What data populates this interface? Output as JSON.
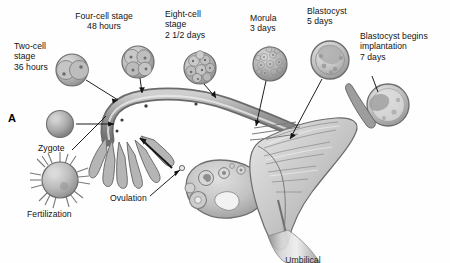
{
  "figure": {
    "panel_letter": "A",
    "title_implied": "Human embryonic development from fertilization to implantation",
    "background_color": "#ffffff",
    "ink_color": "#111111",
    "style": "grayscale medical illustration"
  },
  "labels": {
    "two_cell": "Two-cell\nstage\n36 hours",
    "four_cell": "Four-cell stage\n48 hours",
    "eight_cell": "Eight-cell\nstage\n2 1/2 days",
    "morula": "Morula\n3 days",
    "blastocyst": "Blastocyst\n5 days",
    "implantation": "Blastocyst begins\nimplantation\n7 days",
    "zygote": "Zygote",
    "fertilization": "Fertilization",
    "ovulation": "Ovulation",
    "umbilical": "Umbilical"
  },
  "stages": [
    {
      "name": "Fertilization",
      "time": "",
      "cells": "sperm surrounding oocyte"
    },
    {
      "name": "Zygote",
      "time": "",
      "cells": "1"
    },
    {
      "name": "Two-cell stage",
      "time": "36 hours",
      "cells": "2"
    },
    {
      "name": "Four-cell stage",
      "time": "48 hours",
      "cells": "4"
    },
    {
      "name": "Eight-cell stage",
      "time": "2 1/2 days",
      "cells": "8"
    },
    {
      "name": "Morula",
      "time": "3 days",
      "cells": "many"
    },
    {
      "name": "Blastocyst",
      "time": "5 days",
      "cells": "blastocyst"
    },
    {
      "name": "Blastocyst begins implantation",
      "time": "7 days",
      "cells": "implanting"
    }
  ],
  "anatomy": {
    "ovary": "ovary with follicles",
    "fallopian_tube": "uterine tube",
    "fimbriae": "fimbriae",
    "uterus": "uterus with endometrium"
  },
  "colors": {
    "tube_outline": "#6f6f6f",
    "tube_fill": "#b9b9b9",
    "embryo_fill": "#b0b0b0",
    "embryo_edge": "#7a7a7a",
    "uterus_fill": "#c9c9c9",
    "ovary_fill": "#c4c4c4",
    "leader_line": "#1a1a1a"
  }
}
